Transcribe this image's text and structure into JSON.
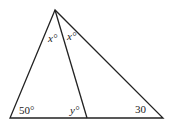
{
  "diagram": {
    "type": "triangle-with-cevian",
    "stroke_color": "#222222",
    "labels": {
      "apex_left_angle": "x°",
      "apex_right_angle": "x°",
      "bottom_left_angle": "50°",
      "cevian_foot_angle": "y°",
      "bottom_right_angle": "30"
    }
  }
}
